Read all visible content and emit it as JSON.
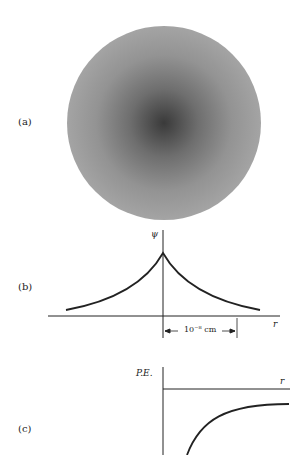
{
  "panels": {
    "a": {
      "label": "(a)",
      "description": "electron-cloud-density"
    },
    "b": {
      "label": "(b)",
      "y_axis": "ψ",
      "x_axis": "r",
      "scale_label": "10⁻⁸ cm"
    },
    "c": {
      "label": "(c)",
      "y_axis": "P.E.",
      "x_axis": "r"
    }
  },
  "colors": {
    "ink": "#222222",
    "cloud_center": "#3a3a3a",
    "cloud_edge": "#9a9a9a"
  }
}
